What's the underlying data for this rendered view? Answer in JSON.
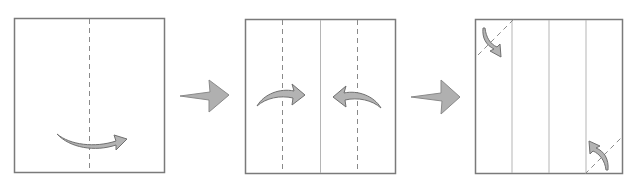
{
  "diagram": {
    "type": "origami-folding-instructions",
    "steps": [
      {
        "index": 1,
        "description": "Fold square in half along vertical center valley line, left to right",
        "square": {
          "x": 14,
          "y": 18,
          "w": 150,
          "h": 155
        },
        "valley_lines": [
          {
            "orientation": "vertical",
            "position": "center"
          }
        ],
        "crease_lines": [],
        "fold_arrows": [
          {
            "direction": "right",
            "location": "bottom-center"
          }
        ]
      },
      {
        "index": 2,
        "description": "Unfolded with center crease; fold both edges to the center along dashed valley lines",
        "square": {
          "x": 245,
          "y": 19,
          "w": 151,
          "h": 155
        },
        "valley_lines": [
          {
            "orientation": "vertical",
            "position": "quarter-left"
          },
          {
            "orientation": "vertical",
            "position": "quarter-right"
          }
        ],
        "crease_lines": [
          {
            "orientation": "vertical",
            "position": "center"
          }
        ],
        "fold_arrows": [
          {
            "direction": "right",
            "location": "left-middle"
          },
          {
            "direction": "left",
            "location": "right-middle"
          }
        ]
      },
      {
        "index": 3,
        "description": "Unfolded showing three creases; fold top-left and bottom-right corners along diagonal valley lines",
        "square": {
          "x": 475,
          "y": 19,
          "w": 148,
          "h": 155
        },
        "valley_lines": [
          {
            "orientation": "diagonal",
            "position": "top-left-corner"
          },
          {
            "orientation": "diagonal",
            "position": "bottom-right-corner"
          }
        ],
        "crease_lines": [
          {
            "orientation": "vertical",
            "position": "quarter-left"
          },
          {
            "orientation": "vertical",
            "position": "center"
          },
          {
            "orientation": "vertical",
            "position": "quarter-right"
          }
        ],
        "fold_arrows": [
          {
            "direction": "down-right",
            "location": "top-left-corner"
          },
          {
            "direction": "up-left",
            "location": "bottom-right-corner"
          }
        ]
      }
    ],
    "step_arrows": [
      {
        "from_step": 1,
        "to_step": 2
      },
      {
        "from_step": 2,
        "to_step": 3
      }
    ],
    "colors": {
      "paper_border": "#7a7a7a",
      "valley_line": "#8a8a8a",
      "crease_line": "#b5b5b5",
      "arrow_fill": "#b3b3b3",
      "arrow_stroke": "#707070"
    }
  }
}
